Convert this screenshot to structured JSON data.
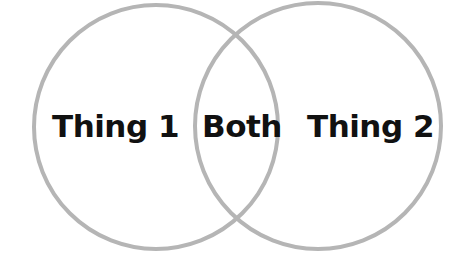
{
  "diagram": {
    "type": "venn",
    "stroke_color": "#b5b5b5",
    "text_color": "#111111",
    "background": "#ffffff",
    "sets": [
      {
        "id": "left",
        "label": "Thing 1",
        "cx": 156,
        "cy": 127,
        "r": 122
      },
      {
        "id": "right",
        "label": "Thing 2",
        "cx": 318,
        "cy": 126,
        "r": 123
      }
    ],
    "intersection": {
      "label": "Both"
    }
  }
}
